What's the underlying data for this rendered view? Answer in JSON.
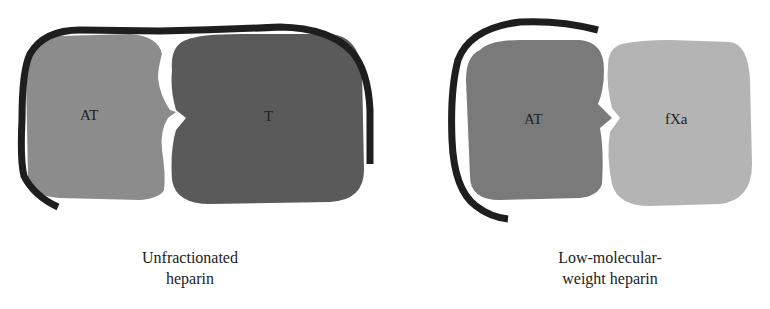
{
  "left_panel": {
    "molecule_1": {
      "label": "AT",
      "color": "#8c8c8c"
    },
    "molecule_2": {
      "label": "T",
      "color": "#5a5a5a"
    },
    "heparin_color": "#1e1e1e",
    "caption_line1": "Unfractionated",
    "caption_line2": "heparin"
  },
  "right_panel": {
    "molecule_1": {
      "label": "AT",
      "color": "#7a7a7a"
    },
    "molecule_2": {
      "label": "fXa",
      "color": "#b4b4b4"
    },
    "heparin_color": "#1e1e1e",
    "caption_line1": "Low-molecular-",
    "caption_line2": "weight heparin"
  }
}
